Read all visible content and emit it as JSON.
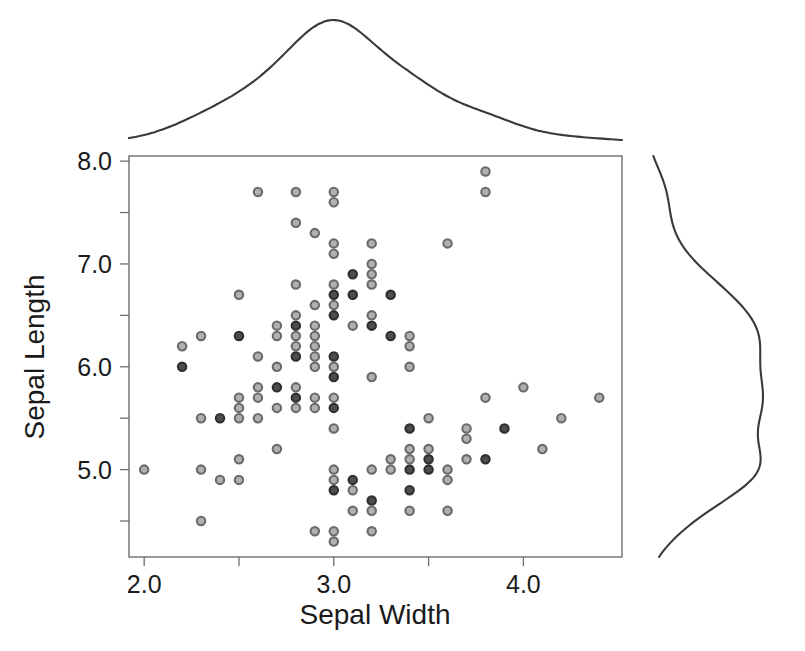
{
  "chart_data": {
    "type": "scatter",
    "title": "",
    "subtitle": "",
    "xlabel": "Sepal Width",
    "ylabel": "Sepal Length",
    "xlim": [
      1.92,
      4.52
    ],
    "ylim": [
      4.15,
      8.05
    ],
    "xticks": [
      2.0,
      2.5,
      3.0,
      3.5,
      4.0
    ],
    "xtick_labels": [
      "2.0",
      "",
      "3.0",
      "",
      "4.0"
    ],
    "yticks": [
      4.5,
      5.0,
      5.5,
      6.0,
      6.5,
      7.0,
      7.5,
      8.0
    ],
    "ytick_labels": [
      "",
      "5.0",
      "",
      "6.0",
      "",
      "7.0",
      "",
      "8.0"
    ],
    "grid": false,
    "legend": null,
    "marker": {
      "shape": "circle",
      "radius_px": 4.2,
      "fill": "#b0b0b0",
      "stroke": "#6a6a6a",
      "fill_dark": "#4d4d4d",
      "stroke_dark": "#2e2e2e",
      "note": "light gray circles; overlapping duplicate observations render darker"
    },
    "marginals": {
      "top": {
        "type": "kde",
        "variable": "Sepal Width",
        "orientation": "horizontal",
        "peak_x": 3.0,
        "description": "unimodal density peaking near 3.0 with a right shoulder near 3.6"
      },
      "right": {
        "type": "kde",
        "variable": "Sepal Length",
        "orientation": "vertical",
        "peak_y": 5.85,
        "description": "broad density with modes near 5.0 and 6.3"
      }
    },
    "x": [
      3.5,
      3.0,
      3.2,
      3.1,
      3.6,
      3.9,
      3.4,
      3.4,
      2.9,
      3.1,
      3.7,
      3.4,
      3.0,
      3.0,
      4.0,
      4.4,
      3.9,
      3.5,
      3.8,
      3.8,
      3.4,
      3.7,
      3.6,
      3.3,
      3.4,
      3.0,
      3.4,
      3.5,
      3.4,
      3.2,
      3.1,
      3.4,
      4.1,
      4.2,
      3.1,
      3.2,
      3.5,
      3.6,
      3.0,
      3.4,
      3.5,
      2.3,
      3.2,
      3.5,
      3.8,
      3.0,
      3.8,
      3.2,
      3.7,
      3.3,
      3.2,
      3.2,
      3.1,
      2.3,
      2.8,
      2.8,
      3.3,
      2.4,
      2.9,
      2.7,
      2.0,
      3.0,
      2.2,
      2.9,
      2.9,
      3.1,
      3.0,
      2.7,
      2.2,
      2.5,
      3.2,
      2.8,
      2.5,
      2.8,
      2.9,
      3.0,
      2.8,
      3.0,
      2.9,
      2.6,
      2.4,
      2.4,
      2.7,
      2.7,
      3.0,
      3.4,
      3.1,
      2.3,
      3.0,
      2.5,
      2.6,
      3.0,
      2.6,
      2.3,
      2.7,
      3.0,
      2.9,
      2.9,
      2.5,
      2.8,
      3.3,
      2.7,
      3.0,
      2.9,
      3.0,
      3.0,
      2.5,
      2.9,
      2.5,
      3.6,
      3.2,
      2.7,
      3.0,
      2.5,
      2.8,
      3.2,
      3.0,
      3.8,
      2.6,
      2.2,
      3.2,
      2.8,
      2.8,
      2.7,
      3.3,
      3.2,
      2.8,
      3.0,
      2.8,
      3.0,
      2.8,
      3.8,
      2.8,
      2.8,
      2.6,
      3.0,
      3.4,
      3.1,
      3.0,
      3.1,
      3.1,
      3.1,
      2.7,
      3.2,
      3.3,
      3.0,
      2.5,
      3.0,
      3.4,
      3.0
    ],
    "y": [
      5.1,
      4.9,
      4.7,
      4.6,
      5.0,
      5.4,
      4.6,
      5.0,
      4.4,
      4.9,
      5.4,
      4.8,
      4.8,
      4.3,
      5.8,
      5.7,
      5.4,
      5.1,
      5.7,
      5.1,
      5.4,
      5.1,
      4.6,
      5.1,
      4.8,
      5.0,
      5.0,
      5.2,
      5.2,
      4.7,
      4.8,
      5.4,
      5.2,
      5.5,
      4.9,
      5.0,
      5.5,
      4.9,
      4.4,
      5.1,
      5.0,
      4.5,
      4.4,
      5.0,
      5.1,
      4.8,
      5.1,
      4.6,
      5.3,
      5.0,
      7.0,
      6.4,
      6.9,
      5.5,
      6.5,
      5.7,
      6.3,
      4.9,
      6.6,
      5.2,
      5.0,
      5.9,
      6.0,
      6.1,
      5.6,
      6.7,
      5.6,
      5.8,
      6.2,
      5.6,
      5.9,
      6.1,
      6.3,
      6.1,
      6.4,
      6.6,
      6.8,
      6.7,
      6.0,
      5.7,
      5.5,
      5.5,
      5.8,
      6.0,
      5.4,
      6.0,
      6.7,
      6.3,
      5.6,
      5.5,
      5.5,
      6.1,
      5.8,
      5.0,
      5.6,
      5.7,
      5.7,
      6.2,
      5.1,
      5.7,
      6.3,
      5.8,
      7.1,
      6.3,
      6.5,
      7.6,
      4.9,
      7.3,
      6.7,
      7.2,
      6.5,
      6.4,
      6.8,
      5.7,
      5.8,
      6.4,
      6.5,
      7.7,
      7.7,
      6.0,
      6.9,
      5.6,
      7.7,
      6.3,
      6.7,
      7.2,
      6.2,
      6.1,
      6.4,
      7.2,
      7.4,
      7.9,
      6.4,
      6.3,
      6.1,
      7.7,
      6.3,
      6.4,
      6.0,
      6.9,
      6.7,
      6.9,
      5.8,
      6.8,
      6.7,
      6.7,
      6.3,
      6.5,
      6.2,
      5.9
    ]
  },
  "axes": {
    "x_title": "Sepal Width",
    "y_title": "Sepal Length",
    "x_tick_labels": [
      "2.0",
      "3.0",
      "4.0"
    ],
    "y_tick_labels": [
      "8.0",
      "7.0",
      "6.0",
      "5.0"
    ]
  },
  "colors": {
    "marker_fill": "#b0b0b0",
    "marker_stroke": "#6a6a6a",
    "marker_fill_dark": "#4d4d4d",
    "marker_stroke_dark": "#2e2e2e",
    "axis": "#6e6e6e",
    "kde": "#3a3a3a",
    "text": "#1a1a1a",
    "background": "#ffffff"
  }
}
